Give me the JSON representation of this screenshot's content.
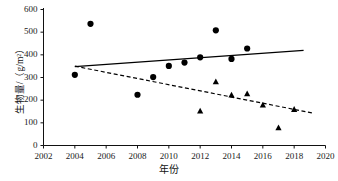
{
  "chart_data": {
    "type": "scatter",
    "title": "",
    "xlabel": "年份",
    "ylabel": "生物量/（g/m²）",
    "xlim": [
      2002,
      2020
    ],
    "ylim": [
      0,
      600
    ],
    "xticks": [
      "2002",
      "2004",
      "2006",
      "2008",
      "2010",
      "2012",
      "2014",
      "2016",
      "2018",
      "2020"
    ],
    "yticks": [
      "0",
      "100",
      "200",
      "300",
      "400",
      "500",
      "600"
    ],
    "grid": false,
    "legend": "none",
    "series": [
      {
        "name": "circle-series",
        "marker": "circle",
        "color": "#000000",
        "points": [
          {
            "x": 2004,
            "y": 312
          },
          {
            "x": 2005,
            "y": 537
          },
          {
            "x": 2008,
            "y": 224
          },
          {
            "x": 2009,
            "y": 302
          },
          {
            "x": 2010,
            "y": 351
          },
          {
            "x": 2011,
            "y": 366
          },
          {
            "x": 2012,
            "y": 389
          },
          {
            "x": 2013,
            "y": 508
          },
          {
            "x": 2014,
            "y": 382
          },
          {
            "x": 2015,
            "y": 428
          }
        ]
      },
      {
        "name": "triangle-series",
        "marker": "triangle",
        "color": "#000000",
        "points": [
          {
            "x": 2012,
            "y": 152
          },
          {
            "x": 2013,
            "y": 281
          },
          {
            "x": 2014,
            "y": 222
          },
          {
            "x": 2015,
            "y": 228
          },
          {
            "x": 2016,
            "y": 178
          },
          {
            "x": 2017,
            "y": 78
          },
          {
            "x": 2018,
            "y": 159
          }
        ]
      }
    ],
    "trendlines": [
      {
        "name": "circle-trend-solid",
        "style": "solid",
        "color": "#000000",
        "x1": 2004,
        "y1": 348,
        "x2": 2018.6,
        "y2": 420
      },
      {
        "name": "triangle-trend-dashed",
        "style": "dashed",
        "color": "#000000",
        "x1": 2004,
        "y1": 350,
        "x2": 2019.2,
        "y2": 143
      }
    ],
    "axis_color": "#111111"
  }
}
